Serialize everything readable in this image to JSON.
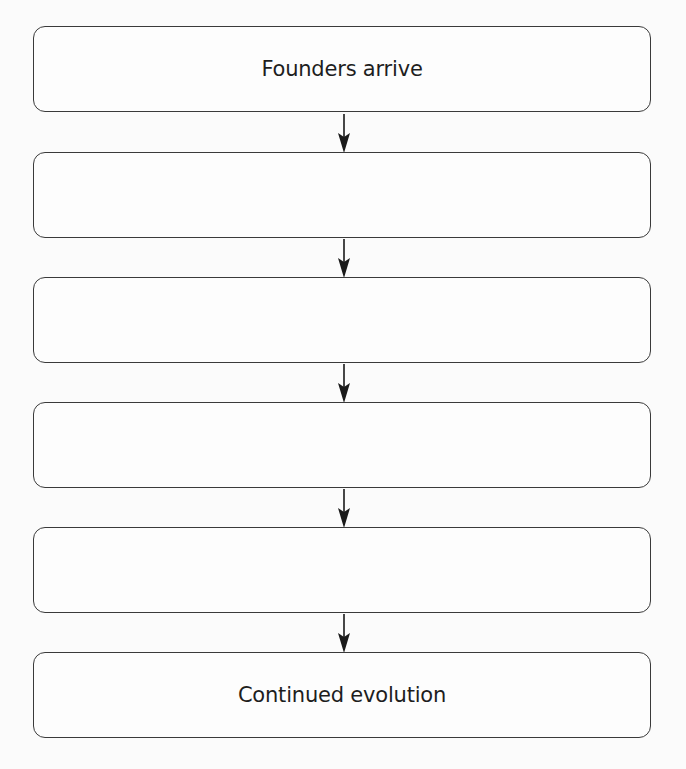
{
  "diagram": {
    "type": "vertical-flowchart",
    "colors": {
      "background": "#fbfbfb",
      "box_border": "#3a3a3a",
      "box_fill": "#fdfdfd",
      "text": "#1e1e1e",
      "arrow": "#1a1a1a"
    },
    "steps": [
      {
        "label": "Founders arrive"
      },
      {
        "label": ""
      },
      {
        "label": ""
      },
      {
        "label": ""
      },
      {
        "label": ""
      },
      {
        "label": "Continued evolution"
      }
    ],
    "connectors": [
      {
        "from": 0,
        "to": 1,
        "icon": "arrow-down-icon"
      },
      {
        "from": 1,
        "to": 2,
        "icon": "arrow-down-icon"
      },
      {
        "from": 2,
        "to": 3,
        "icon": "arrow-down-icon"
      },
      {
        "from": 3,
        "to": 4,
        "icon": "arrow-down-icon"
      },
      {
        "from": 4,
        "to": 5,
        "icon": "arrow-down-icon"
      }
    ]
  }
}
